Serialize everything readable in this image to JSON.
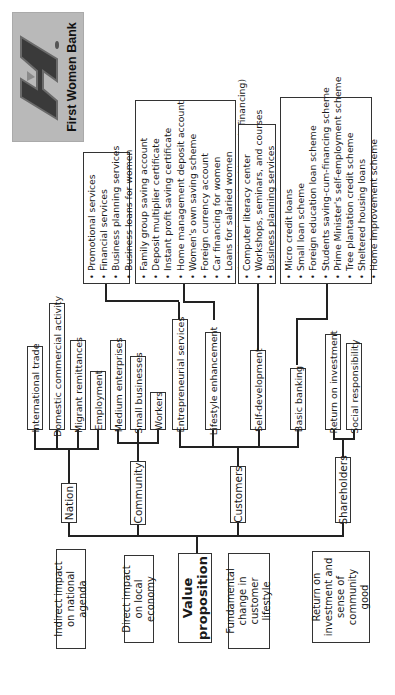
{
  "logo": {
    "text": "First Women Bank",
    "icon": "first-women-bank-logo"
  },
  "root": {
    "label_line1": "Value",
    "label_line2": "proposition"
  },
  "outcomes": [
    {
      "lines": [
        "Indirect impact",
        "on national agenda"
      ]
    },
    {
      "lines": [
        "Direct impact",
        "on local economy"
      ]
    },
    {
      "lines": [
        "Fundamental",
        "change in",
        "customer lifestyle"
      ]
    },
    {
      "lines": [
        "Return on",
        "investment and",
        "sense of",
        "community good"
      ]
    }
  ],
  "stakeholders": [
    {
      "label": "Nation",
      "children": [
        "International trade",
        "Domestic commercial activity",
        "Migrant remittances",
        "Employment"
      ]
    },
    {
      "label": "Community",
      "children": [
        "Medium enterprises",
        "Small businesses",
        "Workers"
      ]
    },
    {
      "label": "Customers",
      "children": [
        "Entrepreneurial services",
        "Lifestyle enhancement",
        "Self-development",
        "Basic banking"
      ]
    },
    {
      "label": "Shareholders",
      "children": [
        "Return on investment",
        "Social responsibility"
      ]
    }
  ],
  "service_lists": {
    "entrepreneurial": [
      "Promotional services",
      "Financial services",
      "Business planning services",
      "Business loans for women"
    ],
    "lifestyle": [
      "Family group saving account",
      "Deposit multiplier certificate",
      "Instant profit saving certificate",
      "Home management deposit account",
      "Women's own saving scheme",
      "Foreign currency account",
      "Car financing for women",
      "Loans for salaried women",
      "Asaish scheme (durable goods financing)"
    ],
    "self_development": [
      "Computer literacy center",
      "Workshops, seminars, and courses",
      "Business planning services"
    ],
    "basic_banking": [
      "Micro credit loans",
      "Small loan scheme",
      "Foreign education loan scheme",
      "Students saving-cum-financing scheme",
      "Prime Minister's self-employment scheme",
      "Tree plantation credit scheme",
      "Sheltered housing loans",
      "Home improvement scheme"
    ]
  }
}
